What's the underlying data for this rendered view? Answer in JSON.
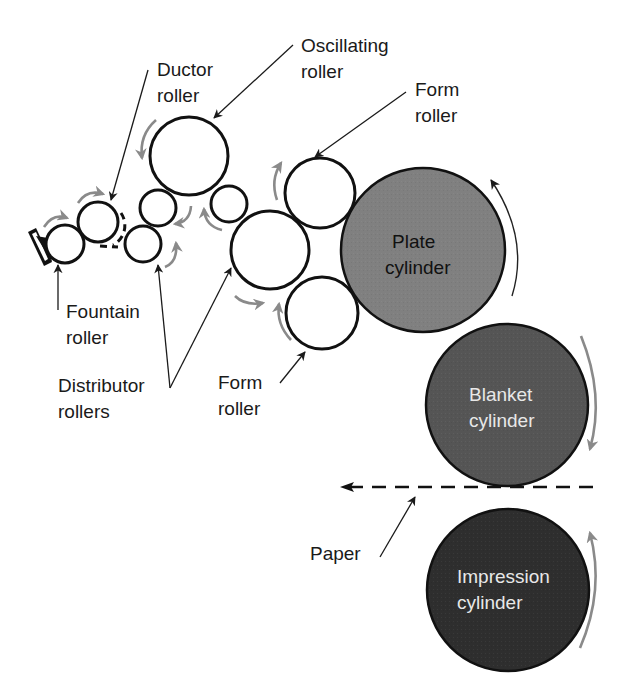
{
  "diagram": {
    "type": "offset lithography press roller/cylinder schematic",
    "colors": {
      "roller_fill": "#ffffff",
      "plate_cylinder": "#808080",
      "blanket_cylinder": "#555555",
      "impression_cylinder": "#2e2e2e",
      "rotation_arrow": "#8a8a8a",
      "outline": "#111111"
    },
    "labels": {
      "ductor": {
        "line1": "Ductor",
        "line2": "roller"
      },
      "oscillating": {
        "line1": "Oscillating",
        "line2": "roller"
      },
      "form_top": {
        "line1": "Form",
        "line2": "roller"
      },
      "fountain": {
        "line1": "Fountain",
        "line2": "roller"
      },
      "distributor": {
        "line1": "Distributor",
        "line2": "rollers"
      },
      "form_bottom": {
        "line1": "Form",
        "line2": "roller"
      },
      "plate": {
        "line1": "Plate",
        "line2": "cylinder"
      },
      "blanket": {
        "line1": "Blanket",
        "line2": "cylinder"
      },
      "impression": {
        "line1": "Impression",
        "line2": "cylinder"
      },
      "paper": "Paper"
    },
    "nodes": [
      {
        "id": "fountain-roller",
        "label": "Fountain roller"
      },
      {
        "id": "ductor-roller",
        "label": "Ductor roller"
      },
      {
        "id": "distributor-roller-small-upper",
        "label": "Distributor roller"
      },
      {
        "id": "distributor-roller-small-lower",
        "label": "Distributor roller"
      },
      {
        "id": "oscillating-roller",
        "label": "Oscillating roller"
      },
      {
        "id": "distributor-roller-small-right",
        "label": "Distributor roller"
      },
      {
        "id": "distributor-roller-large",
        "label": "Distributor roller"
      },
      {
        "id": "form-roller-top",
        "label": "Form roller"
      },
      {
        "id": "form-roller-bottom",
        "label": "Form roller"
      },
      {
        "id": "plate-cylinder",
        "label": "Plate cylinder"
      },
      {
        "id": "blanket-cylinder",
        "label": "Blanket cylinder"
      },
      {
        "id": "impression-cylinder",
        "label": "Impression cylinder"
      }
    ],
    "paper_path": {
      "label": "Paper",
      "direction": "right-to-left"
    }
  }
}
